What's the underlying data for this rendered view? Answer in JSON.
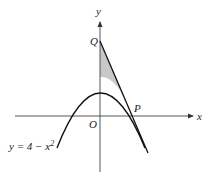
{
  "diagram": {
    "axes": {
      "x_label": "x",
      "y_label": "y",
      "origin_label": "O"
    },
    "points": {
      "Q": "Q",
      "P": "P"
    },
    "curve_label": {
      "prefix": "y = 4 − x",
      "exponent": "2"
    },
    "colors": {
      "stroke": "#111111",
      "axis": "#444444",
      "shade": "#c8c8c8"
    }
  }
}
